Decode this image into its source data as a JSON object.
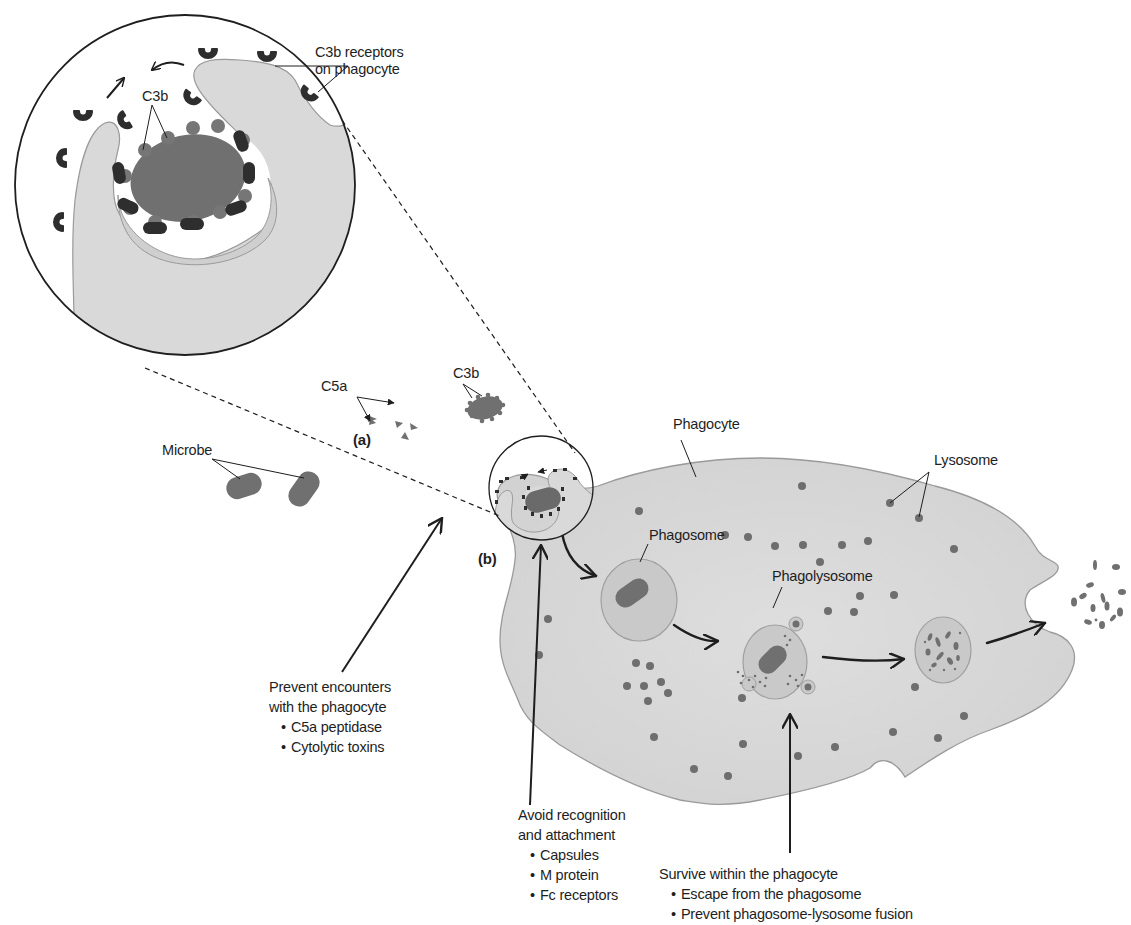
{
  "figure": {
    "colors": {
      "background": "#ffffff",
      "cell_fill": "#d9d9d9",
      "cell_outline": "#9a9a9a",
      "microbe": "#707070",
      "receptor": "#2e2e2e",
      "lysosome": "#6e6e6e",
      "phagosome_fill": "#c9c9c9",
      "line": "#1e1e1e"
    },
    "panels": {
      "a": "(a)",
      "b": "(b)"
    },
    "labels": {
      "c3b_receptors_line1": "C3b receptors",
      "c3b_receptors_line2": "on phagocyte",
      "c3b_inset": "C3b",
      "c3b": "C3b",
      "c5a": "C5a",
      "microbe": "Microbe",
      "phagocyte": "Phagocyte",
      "lysosome": "Lysosome",
      "phagosome": "Phagosome",
      "phagolysosome": "Phagolysosome"
    },
    "strategies": [
      {
        "title_line1": "Prevent encounters",
        "title_line2": "with the phagocyte",
        "items": [
          "C5a peptidase",
          "Cytolytic toxins"
        ]
      },
      {
        "title_line1": "Avoid recognition",
        "title_line2": "and attachment",
        "items": [
          "Capsules",
          "M protein",
          "Fc receptors"
        ]
      },
      {
        "title_line1": "Survive within the phagocyte",
        "items": [
          "Escape from the phagosome",
          "Prevent phagosome-lysosome fusion"
        ]
      }
    ]
  }
}
